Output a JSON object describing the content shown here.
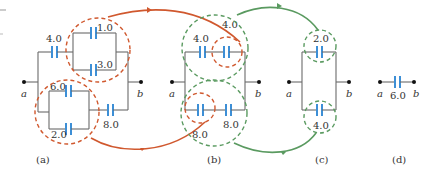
{
  "figure": {
    "colors": {
      "wire": "#6b6b6b",
      "capacitor": "#3d8fd6",
      "reduction_1": "#d0582e",
      "reduction_2": "#5a9a60"
    },
    "panels": [
      {
        "id": "a",
        "caption": "(a)",
        "node_a": "a",
        "node_b": "b",
        "capacitors": [
          "4.0",
          "1.0",
          "3.0",
          "6.0",
          "2.0",
          "8.0"
        ]
      },
      {
        "id": "b",
        "caption": "(b)",
        "node_a": "a",
        "node_b": "b",
        "capacitors": [
          "4.0",
          "4.0",
          "8.0",
          "8.0"
        ]
      },
      {
        "id": "c",
        "caption": "(c)",
        "node_a": "a",
        "node_b": "b",
        "capacitors": [
          "2.0",
          "4.0"
        ]
      },
      {
        "id": "d",
        "caption": "(d)",
        "node_a": "a",
        "node_b": "b",
        "capacitors": [
          "6.0"
        ]
      }
    ]
  }
}
